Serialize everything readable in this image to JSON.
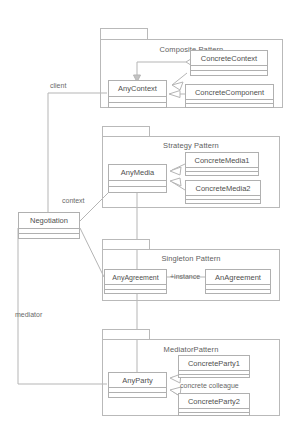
{
  "diagram": {
    "background_color": "#ffffff",
    "line_color": "#b0b0b0",
    "text_color": "#5a5a5a"
  },
  "packages": [
    {
      "id": "composite",
      "title": "Composite Pattern",
      "classes": [
        {
          "id": "anycontext",
          "name": "AnyContext"
        },
        {
          "id": "concretecontext",
          "name": "ConcreteContext"
        },
        {
          "id": "concretecomponent",
          "name": "ConcreteComponent"
        }
      ]
    },
    {
      "id": "strategy",
      "title": "Strategy Pattern",
      "classes": [
        {
          "id": "anymedia",
          "name": "AnyMedia"
        },
        {
          "id": "concretemedia1",
          "name": "ConcreteMedia1"
        },
        {
          "id": "concretemedia2",
          "name": "ConcreteMedia2"
        }
      ]
    },
    {
      "id": "singleton",
      "title": "Singleton Pattern",
      "classes": [
        {
          "id": "anyagreement",
          "name": "AnyAgreement"
        },
        {
          "id": "anagreement",
          "name": "AnAgreement"
        }
      ],
      "association_label": "+instance"
    },
    {
      "id": "mediator",
      "title": "MediatorPattern",
      "classes": [
        {
          "id": "anyparty",
          "name": "AnyParty"
        },
        {
          "id": "concreteparty1",
          "name": "ConcreteParty1"
        },
        {
          "id": "concreteparty2",
          "name": "ConcreteParty2"
        }
      ],
      "association_label": "concrete colleague"
    }
  ],
  "central_class": {
    "id": "negotiation",
    "name": "Negotiation"
  },
  "role_labels": [
    {
      "id": "client",
      "text": "client"
    },
    {
      "id": "context",
      "text": "context"
    },
    {
      "id": "mediator",
      "text": "mediator"
    }
  ]
}
